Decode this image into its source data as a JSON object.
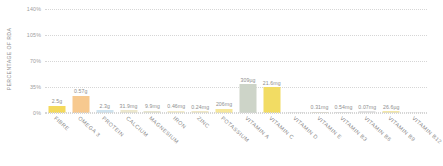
{
  "chart_data": {
    "type": "bar",
    "title": "",
    "xlabel": "",
    "ylabel": "PERCENTAGE OF RDA",
    "ylim": [
      0,
      140
    ],
    "yticks": [
      0,
      35,
      70,
      105,
      140
    ],
    "ytick_labels": [
      "0%",
      "35%",
      "70%",
      "105%",
      "140%"
    ],
    "grid": true,
    "legend": "none",
    "categories": [
      "FIBRE",
      "OMEGA 3",
      "PROTEIN",
      "CALCIUM",
      "MAGNESIUM",
      "IRON",
      "ZINC",
      "POTASSIUM",
      "VITAMIN A",
      "VITAMIN C",
      "VITAMIN D",
      "VITAMIN E",
      "VITAMIN B3",
      "VITAMIN B6",
      "VITAMIN B9",
      "VITAMIN B12"
    ],
    "values": [
      10,
      23,
      4,
      4,
      3,
      3,
      2.5,
      6,
      38.5,
      35,
      0.8,
      1.2,
      2,
      2.5,
      2.5,
      1.2
    ],
    "data_labels": [
      "2.5g",
      "0.57g",
      "2.3g",
      "31.9mg",
      "9.9mg",
      "0.46mg",
      "0.24mg",
      "206mg",
      "309µg",
      "21.6mg",
      "",
      "0.31mg",
      "0.54mg",
      "0.07mg",
      "26.6µg",
      ""
    ],
    "bar_colors": [
      "#f4d95c",
      "#f7c98f",
      "#cfe3ef",
      "#ece7cd",
      "#e8e6cf",
      "#f3eccb",
      "#f0e8c6",
      "#f6e79a",
      "#cdd4c8",
      "#f2dc63",
      "#e9e9e9",
      "#ded9c9",
      "#dedede",
      "#e3e3e3",
      "#f3e7a8",
      "#f0f0f0"
    ]
  },
  "axis": {
    "y_title": "PERCENTAGE OF RDA"
  }
}
